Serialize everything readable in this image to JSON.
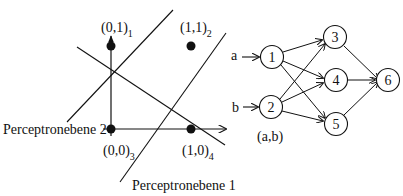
{
  "colors": {
    "ink": "#111111",
    "background": "#ffffff"
  },
  "left_plot": {
    "points": [
      {
        "coord": "(0,1)",
        "index": "1",
        "x": 111,
        "y": 46
      },
      {
        "coord": "(1,1)",
        "index": "2",
        "x": 191,
        "y": 46
      },
      {
        "coord": "(0,0)",
        "index": "3",
        "x": 111,
        "y": 129
      },
      {
        "coord": "(1,0)",
        "index": "4",
        "x": 191,
        "y": 129
      }
    ],
    "planes": [
      {
        "label": "Perceptronebene 1"
      },
      {
        "label": "Perceptronebene 2"
      }
    ]
  },
  "network": {
    "inputs": [
      {
        "label": "a"
      },
      {
        "label": "b"
      }
    ],
    "input_pair_label": "(a,b)",
    "nodes": [
      {
        "id": "1"
      },
      {
        "id": "2"
      },
      {
        "id": "3"
      },
      {
        "id": "4"
      },
      {
        "id": "5"
      },
      {
        "id": "6"
      }
    ],
    "edges": [
      [
        "a",
        "1"
      ],
      [
        "b",
        "2"
      ],
      [
        "1",
        "3"
      ],
      [
        "1",
        "4"
      ],
      [
        "1",
        "5"
      ],
      [
        "2",
        "3"
      ],
      [
        "2",
        "4"
      ],
      [
        "2",
        "5"
      ],
      [
        "3",
        "6"
      ],
      [
        "4",
        "6"
      ],
      [
        "5",
        "6"
      ]
    ]
  }
}
